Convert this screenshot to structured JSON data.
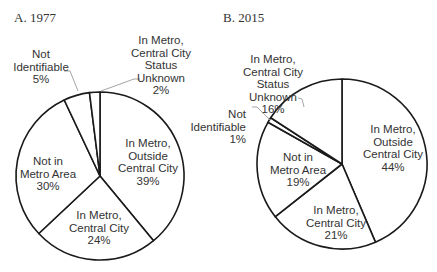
{
  "figure": {
    "panels": [
      {
        "title": "A. 1977"
      },
      {
        "title": "B. 2015"
      }
    ]
  },
  "colors": {
    "slice_fill": "#ffffff",
    "slice_stroke": "#1a1a1a",
    "leader_line": "#9a9a9a",
    "text": "#333333"
  },
  "chart_data": [
    {
      "type": "pie",
      "title": "A. 1977",
      "start_angle": "12 o'clock",
      "direction": "clockwise",
      "categories": [
        "In Metro, Outside Central City",
        "In Metro, Central City",
        "Not in Metro Area",
        "Not Identifiable",
        "In Metro, Central City Status Unknown"
      ],
      "values": [
        39,
        24,
        30,
        5,
        2
      ],
      "unit": "%",
      "geometry": {
        "cx": 100,
        "cy": 176,
        "r": 84
      },
      "labels": [
        {
          "lines": [
            "In Metro,",
            "Outside",
            "Central City",
            "39%"
          ],
          "x": 148,
          "y": 147,
          "anchor": "middle"
        },
        {
          "lines": [
            "In Metro,",
            "Central City",
            "24%"
          ],
          "x": 99,
          "y": 219,
          "anchor": "middle"
        },
        {
          "lines": [
            "Not in",
            "Metro Area",
            "30%"
          ],
          "x": 48,
          "y": 165,
          "anchor": "middle"
        },
        {
          "lines": [
            "Not",
            "Identifiable",
            "5%"
          ],
          "x": 41,
          "y": 58,
          "anchor": "middle",
          "leader": [
            [
              64,
              71
            ],
            [
              70,
              71
            ],
            [
              78,
              91
            ]
          ]
        },
        {
          "lines": [
            "In Metro,",
            "Central City",
            "Status",
            "Unknown",
            "2%"
          ],
          "x": 161,
          "y": 44,
          "anchor": "middle",
          "leader": [
            [
              140,
              79
            ],
            [
              134,
              79
            ],
            [
              101,
              91
            ]
          ]
        }
      ]
    },
    {
      "type": "pie",
      "title": "B. 2015",
      "start_angle": "12 o'clock",
      "direction": "clockwise",
      "categories": [
        "In Metro, Outside Central City",
        "In Metro, Central City",
        "Not in Metro Area",
        "Not Identifiable",
        "In Metro, Central City Status Unknown"
      ],
      "values": [
        44,
        21,
        19,
        1,
        16
      ],
      "unit": "%",
      "geometry": {
        "cx": 342,
        "cy": 164,
        "r": 85
      },
      "labels": [
        {
          "lines": [
            "In Metro,",
            "Outside",
            "Central City",
            "44%"
          ],
          "x": 393,
          "y": 133,
          "anchor": "middle"
        },
        {
          "lines": [
            "In Metro,",
            "Central City",
            "21%"
          ],
          "x": 336,
          "y": 214,
          "anchor": "middle"
        },
        {
          "lines": [
            "Not in",
            "Metro Area",
            "19%"
          ],
          "x": 298,
          "y": 161,
          "anchor": "middle"
        },
        {
          "lines": [
            "Not",
            "Identifiable",
            "1%"
          ],
          "x": 246,
          "y": 118,
          "anchor": "end",
          "leader": [
            [
              252,
              107
            ],
            [
              257,
              107
            ],
            [
              270,
              120
            ]
          ]
        },
        {
          "lines": [
            "In Metro,",
            "Central City",
            "Status",
            "Unknown",
            "16%"
          ],
          "x": 273,
          "y": 63,
          "anchor": "middle",
          "leader": [
            [
              298,
              98
            ],
            [
              302,
              99
            ],
            [
              304,
              107
            ]
          ]
        }
      ]
    }
  ]
}
